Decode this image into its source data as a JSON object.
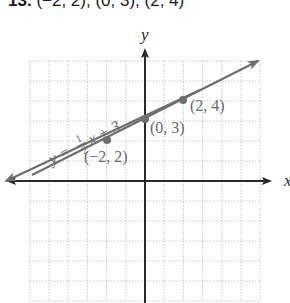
{
  "header": {
    "number": "13.",
    "points_text": "(−2, 2), (0, 3), (2, 4)"
  },
  "axes": {
    "x_label": "x",
    "y_label": "y"
  },
  "equation": {
    "lhs": "y =",
    "num": "1",
    "den": "2",
    "rhs": "x + 3"
  },
  "labels": {
    "p1": "(−2, 2)",
    "p2": "(0, 3)",
    "p3": "(2, 4)"
  },
  "colors": {
    "axis": "#2a2a2a",
    "line": "#6e6e6e",
    "grid": "#c8c8c8",
    "label": "#6a6a6a"
  },
  "chart_data": {
    "type": "line",
    "title": "",
    "xlabel": "x",
    "ylabel": "y",
    "xlim": [
      -6,
      6
    ],
    "ylim": [
      -6,
      6
    ],
    "grid": true,
    "series": [
      {
        "name": "y = 1/2 x + 3",
        "slope": 0.5,
        "intercept": 3,
        "points": [
          {
            "x": -2,
            "y": 2,
            "label": "(−2, 2)"
          },
          {
            "x": 0,
            "y": 3,
            "label": "(0, 3)"
          },
          {
            "x": 2,
            "y": 4,
            "label": "(2, 4)"
          }
        ]
      }
    ],
    "annotations": [
      "y = 1/2 x + 3",
      "(−2, 2)",
      "(0, 3)",
      "(2, 4)"
    ]
  }
}
